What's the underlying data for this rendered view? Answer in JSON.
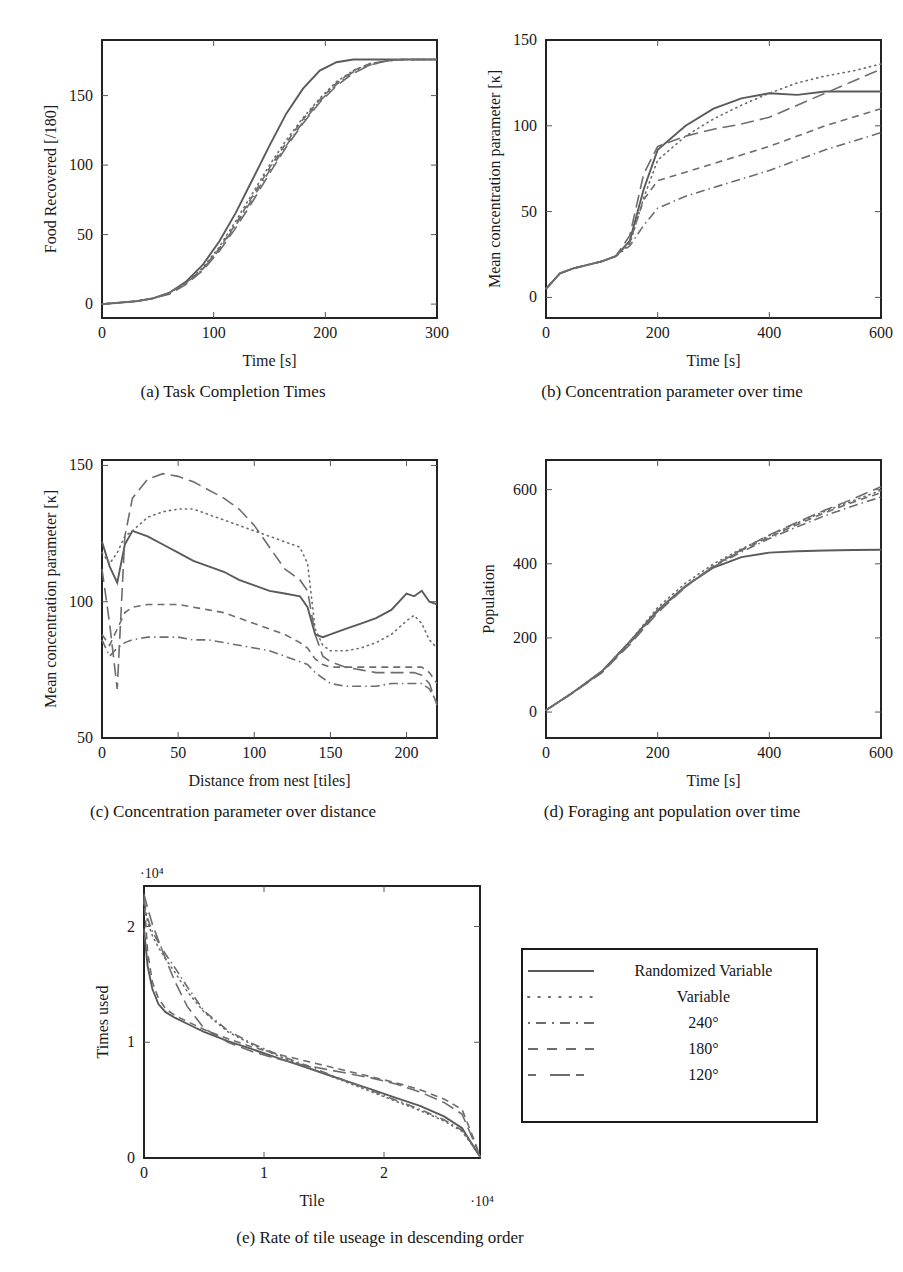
{
  "figure": {
    "panels": [
      {
        "tag": "a",
        "caption": "(a) Task Completion Times"
      },
      {
        "tag": "b",
        "caption": "(b) Concentration parameter over time"
      },
      {
        "tag": "c",
        "caption": "(c) Concentration parameter over distance"
      },
      {
        "tag": "d",
        "caption": "(d) Foraging ant population over time"
      },
      {
        "tag": "e",
        "caption": "(e) Rate of tile useage in descending order"
      }
    ]
  },
  "legend": {
    "entries": [
      {
        "label": "Randomized Variable",
        "style": "solid"
      },
      {
        "label": "Variable",
        "style": "dotted"
      },
      {
        "label": "240°",
        "style": "dashdot"
      },
      {
        "label": "180°",
        "style": "dashed"
      },
      {
        "label": "120°",
        "style": "longdash"
      }
    ]
  },
  "chart_data": [
    {
      "id": "a",
      "type": "line",
      "title": "(a) Task Completion Times",
      "xlabel": "Time [s]",
      "ylabel": "Food Recovered [/180]",
      "xlim": [
        0,
        300
      ],
      "ylim": [
        -10,
        190
      ],
      "xticks": [
        0,
        100,
        200,
        300
      ],
      "yticks": [
        0,
        50,
        100,
        150
      ],
      "grid": false,
      "legend_position": "external",
      "x": [
        0,
        15,
        30,
        45,
        60,
        75,
        90,
        105,
        120,
        135,
        150,
        165,
        180,
        195,
        210,
        225,
        240,
        255,
        270,
        285,
        300
      ],
      "series": [
        {
          "name": "Randomized Variable",
          "style": "solid",
          "values": [
            0,
            1,
            2,
            4,
            8,
            16,
            28,
            45,
            66,
            90,
            114,
            137,
            155,
            168,
            174,
            176,
            176,
            176,
            176,
            176,
            176
          ]
        },
        {
          "name": "Variable",
          "style": "dotted",
          "values": [
            0,
            1,
            2,
            4,
            8,
            15,
            26,
            41,
            60,
            80,
            100,
            118,
            134,
            148,
            160,
            168,
            173,
            175,
            176,
            176,
            176
          ]
        },
        {
          "name": "240°",
          "style": "dashdot",
          "values": [
            0,
            1,
            2,
            4,
            8,
            15,
            25,
            39,
            57,
            76,
            96,
            114,
            131,
            146,
            158,
            167,
            172,
            175,
            176,
            176,
            176
          ]
        },
        {
          "name": "180°",
          "style": "dashed",
          "values": [
            0,
            1,
            2,
            4,
            8,
            15,
            25,
            40,
            58,
            78,
            98,
            116,
            133,
            147,
            159,
            168,
            173,
            175,
            176,
            176,
            176
          ]
        },
        {
          "name": "120°",
          "style": "longdash",
          "values": [
            0,
            1,
            2,
            4,
            7,
            14,
            24,
            38,
            55,
            74,
            94,
            113,
            130,
            145,
            157,
            166,
            172,
            175,
            176,
            176,
            176
          ]
        }
      ]
    },
    {
      "id": "b",
      "type": "line",
      "title": "(b) Concentration parameter over time",
      "xlabel": "Time [s]",
      "ylabel": "Mean concentration parameter [κ]",
      "xlim": [
        0,
        600
      ],
      "ylim": [
        -12,
        150
      ],
      "xticks": [
        0,
        200,
        400,
        600
      ],
      "yticks": [
        0,
        50,
        100,
        150
      ],
      "grid": false,
      "legend_position": "external",
      "x": [
        0,
        25,
        50,
        75,
        100,
        125,
        150,
        175,
        200,
        250,
        300,
        350,
        400,
        450,
        500,
        550,
        600
      ],
      "series": [
        {
          "name": "Randomized Variable",
          "style": "solid",
          "values": [
            5,
            14,
            17,
            19,
            21,
            24,
            33,
            63,
            86,
            100,
            110,
            116,
            119,
            118,
            120,
            120,
            120
          ]
        },
        {
          "name": "Variable",
          "style": "dotted",
          "values": [
            5,
            14,
            17,
            19,
            21,
            24,
            31,
            58,
            80,
            94,
            104,
            112,
            119,
            125,
            129,
            132,
            136
          ]
        },
        {
          "name": "240°",
          "style": "dashdot",
          "values": [
            5,
            14,
            17,
            19,
            21,
            24,
            30,
            42,
            52,
            59,
            64,
            69,
            74,
            80,
            86,
            91,
            96
          ]
        },
        {
          "name": "180°",
          "style": "dashed",
          "values": [
            5,
            14,
            17,
            19,
            21,
            24,
            32,
            57,
            68,
            73,
            78,
            83,
            88,
            94,
            100,
            105,
            110
          ]
        },
        {
          "name": "120°",
          "style": "longdash",
          "values": [
            5,
            14,
            17,
            19,
            21,
            24,
            36,
            72,
            88,
            94,
            98,
            101,
            105,
            112,
            119,
            126,
            133
          ]
        }
      ]
    },
    {
      "id": "c",
      "type": "line",
      "title": "(c) Concentration parameter over distance",
      "xlabel": "Distance from nest [tiles]",
      "ylabel": "Mean concentration parameter [κ]",
      "xlim": [
        0,
        220
      ],
      "ylim": [
        50,
        152
      ],
      "xticks": [
        0,
        50,
        100,
        150,
        200
      ],
      "yticks": [
        50,
        100,
        150
      ],
      "grid": false,
      "legend_position": "external",
      "x": [
        0,
        5,
        10,
        15,
        20,
        30,
        40,
        50,
        60,
        70,
        80,
        90,
        100,
        110,
        120,
        130,
        135,
        140,
        145,
        150,
        160,
        170,
        180,
        190,
        200,
        205,
        210,
        215,
        220
      ],
      "series": [
        {
          "name": "Randomized Variable",
          "style": "solid",
          "values": [
            122,
            113,
            107,
            121,
            126,
            124,
            121,
            118,
            115,
            113,
            111,
            108,
            106,
            104,
            103,
            102,
            98,
            88,
            87,
            88,
            90,
            92,
            94,
            97,
            103,
            102,
            104,
            100,
            99
          ]
        },
        {
          "name": "Variable",
          "style": "dotted",
          "values": [
            118,
            114,
            118,
            124,
            126,
            131,
            133,
            134,
            134,
            132,
            130,
            128,
            126,
            124,
            122,
            120,
            114,
            90,
            84,
            82,
            82,
            83,
            85,
            88,
            93,
            95,
            92,
            86,
            83
          ]
        },
        {
          "name": "240°",
          "style": "dashdot",
          "values": [
            86,
            80,
            83,
            85,
            86,
            87,
            87,
            87,
            86,
            86,
            85,
            84,
            83,
            82,
            80,
            78,
            77,
            74,
            72,
            70,
            69,
            69,
            69,
            70,
            70,
            70,
            70,
            68,
            63
          ]
        },
        {
          "name": "180°",
          "style": "dashed",
          "values": [
            88,
            84,
            90,
            96,
            98,
            99,
            99,
            99,
            98,
            97,
            96,
            94,
            92,
            90,
            88,
            85,
            83,
            79,
            77,
            76,
            76,
            76,
            76,
            76,
            76,
            76,
            76,
            74,
            70
          ]
        },
        {
          "name": "120°",
          "style": "longdash",
          "values": [
            112,
            92,
            68,
            124,
            138,
            145,
            147,
            146,
            144,
            141,
            138,
            134,
            128,
            120,
            112,
            108,
            104,
            88,
            80,
            78,
            76,
            75,
            74,
            74,
            74,
            74,
            73,
            70,
            62
          ]
        }
      ]
    },
    {
      "id": "d",
      "type": "line",
      "title": "(d) Foraging ant population over time",
      "xlabel": "Time [s]",
      "ylabel": "Population",
      "xlim": [
        0,
        600
      ],
      "ylim": [
        -70,
        680
      ],
      "xticks": [
        0,
        200,
        400,
        600
      ],
      "yticks": [
        0,
        200,
        400,
        600
      ],
      "grid": false,
      "legend_position": "external",
      "x": [
        0,
        50,
        100,
        150,
        200,
        250,
        300,
        350,
        400,
        450,
        500,
        550,
        600
      ],
      "series": [
        {
          "name": "Randomized Variable",
          "style": "solid",
          "values": [
            5,
            55,
            110,
            190,
            275,
            340,
            390,
            418,
            430,
            434,
            436,
            437,
            438
          ]
        },
        {
          "name": "Variable",
          "style": "dotted",
          "values": [
            5,
            55,
            110,
            190,
            282,
            348,
            400,
            440,
            476,
            510,
            542,
            570,
            598
          ]
        },
        {
          "name": "240°",
          "style": "dashdot",
          "values": [
            5,
            54,
            108,
            186,
            272,
            338,
            392,
            432,
            468,
            500,
            530,
            556,
            580
          ]
        },
        {
          "name": "180°",
          "style": "dashed",
          "values": [
            5,
            54,
            108,
            186,
            272,
            340,
            394,
            436,
            472,
            506,
            538,
            566,
            592
          ]
        },
        {
          "name": "120°",
          "style": "longdash",
          "values": [
            5,
            54,
            106,
            182,
            268,
            338,
            394,
            438,
            478,
            512,
            545,
            575,
            608
          ]
        }
      ]
    },
    {
      "id": "e",
      "type": "line",
      "title": "(e) Rate of tile useage in descending order",
      "xlabel": "Tile",
      "ylabel": "Times used",
      "x_exponent": "·10⁴",
      "y_exponent": "·10⁴",
      "xlim": [
        0,
        28000
      ],
      "ylim": [
        0,
        23500
      ],
      "xticks": [
        0,
        10000,
        20000
      ],
      "xticklabels": [
        "0",
        "1",
        "2"
      ],
      "yticks": [
        0,
        10000,
        20000
      ],
      "yticklabels": [
        "0",
        "1",
        "2"
      ],
      "grid": false,
      "legend_position": "external",
      "x": [
        0,
        300,
        700,
        1200,
        1800,
        2600,
        3600,
        5000,
        7000,
        9000,
        11000,
        13000,
        15000,
        17000,
        19000,
        21000,
        23000,
        25000,
        26500,
        27500,
        28000
      ],
      "series": [
        {
          "name": "Randomized Variable",
          "style": "solid",
          "values": [
            19800,
            16600,
            14600,
            13300,
            12600,
            12100,
            11600,
            10900,
            10100,
            9400,
            8700,
            8000,
            7300,
            6600,
            5900,
            5200,
            4500,
            3600,
            2600,
            900,
            100
          ]
        },
        {
          "name": "Variable",
          "style": "dotted",
          "values": [
            22000,
            20400,
            19200,
            18200,
            17200,
            16000,
            14400,
            12600,
            10900,
            9800,
            8900,
            8100,
            7300,
            6500,
            5700,
            4900,
            4100,
            3200,
            2300,
            900,
            100
          ]
        },
        {
          "name": "240°",
          "style": "dashdot",
          "values": [
            22300,
            20700,
            19600,
            18600,
            17600,
            16400,
            14800,
            12700,
            11000,
            9900,
            9000,
            8200,
            7400,
            6600,
            5800,
            5000,
            4200,
            3300,
            2400,
            1000,
            120
          ]
        },
        {
          "name": "180°",
          "style": "dashed",
          "values": [
            22600,
            17800,
            15200,
            13800,
            12900,
            12300,
            11800,
            11100,
            10300,
            9600,
            9000,
            8500,
            8000,
            7500,
            7000,
            6500,
            5900,
            5100,
            4200,
            1600,
            150
          ]
        },
        {
          "name": "120°",
          "style": "longdash",
          "values": [
            22800,
            21600,
            20200,
            18800,
            17200,
            15200,
            13100,
            11200,
            10000,
            9200,
            8600,
            8100,
            7700,
            7300,
            6900,
            6400,
            5700,
            4800,
            3800,
            1400,
            130
          ]
        }
      ]
    }
  ]
}
